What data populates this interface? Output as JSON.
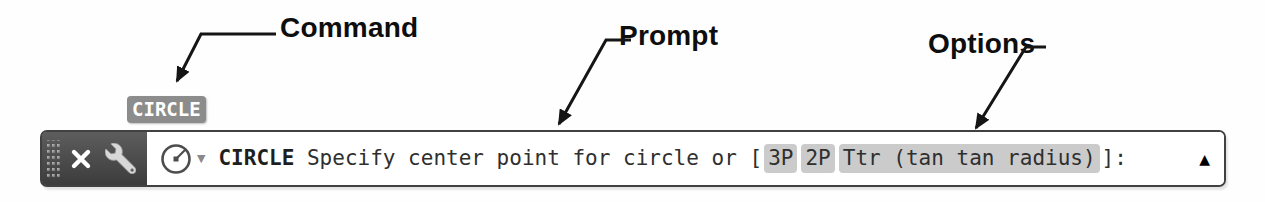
{
  "annotations": {
    "command_label": "Command",
    "prompt_label": "Prompt",
    "options_label": "Options"
  },
  "command_badge": {
    "text": "CIRCLE"
  },
  "command_line": {
    "command": "CIRCLE",
    "prompt_text": " Specify center point for circle or ",
    "bracket_open": "[",
    "options": [
      "3P",
      "2P",
      "Ttr (tan tan radius)"
    ],
    "bracket_close": "]:"
  },
  "icons": {
    "grip": "drag-handle-dots",
    "close": "x-cross",
    "customize": "wrench",
    "recent_commands": "circle-with-radius",
    "dropdown_glyph": "▼",
    "expand_glyph": "▲"
  },
  "colors": {
    "controls_background": "#474747",
    "command_badge_background": "#8c8c8c",
    "option_highlight": "#cbcbcb",
    "bar_border": "#414141",
    "text": "#2f2f2f"
  }
}
